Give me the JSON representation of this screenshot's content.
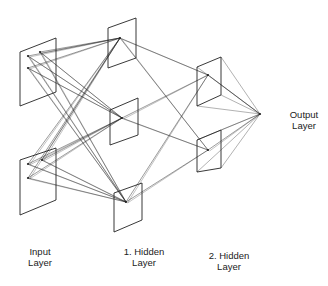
{
  "diagram": {
    "type": "neural-network",
    "labels": {
      "input": [
        "Input",
        "Layer"
      ],
      "hidden1": [
        "1. Hidden",
        "Layer"
      ],
      "hidden2": [
        "2. Hidden",
        "Layer"
      ],
      "output": [
        "Output",
        "Layer"
      ]
    },
    "layers": [
      {
        "name": "input",
        "planes": [
          {
            "pts": [
              [
                20,
                52
              ],
              [
                56,
                38
              ],
              [
                56,
                92
              ],
              [
                20,
                106
              ]
            ],
            "nodes": [
              [
                28,
                56
              ],
              [
                40,
                52
              ],
              [
                28,
                68
              ]
            ]
          },
          {
            "pts": [
              [
                20,
                160
              ],
              [
                56,
                148
              ],
              [
                56,
                200
              ],
              [
                20,
                215
              ]
            ],
            "nodes": [
              [
                28,
                164
              ],
              [
                42,
                160
              ],
              [
                28,
                178
              ]
            ]
          }
        ]
      },
      {
        "name": "hidden1",
        "planes": [
          {
            "pts": [
              [
                108,
                28
              ],
              [
                136,
                18
              ],
              [
                136,
                58
              ],
              [
                108,
                68
              ]
            ],
            "nodes": [
              [
                120,
                38
              ]
            ]
          },
          {
            "pts": [
              [
                110,
                110
              ],
              [
                138,
                98
              ],
              [
                138,
                135
              ],
              [
                110,
                145
              ]
            ],
            "nodes": [
              [
                122,
                118
              ]
            ]
          },
          {
            "pts": [
              [
                114,
                193
              ],
              [
                142,
                183
              ],
              [
                142,
                220
              ],
              [
                114,
                232
              ]
            ],
            "nodes": [
              [
                126,
                202
              ]
            ]
          }
        ]
      },
      {
        "name": "hidden2",
        "planes": [
          {
            "pts": [
              [
                197,
                67
              ],
              [
                221,
                57
              ],
              [
                221,
                95
              ],
              [
                197,
                106
              ]
            ],
            "nodes": [
              [
                208,
                75
              ]
            ]
          },
          {
            "pts": [
              [
                197,
                140
              ],
              [
                221,
                130
              ],
              [
                221,
                168
              ],
              [
                197,
                172
              ]
            ],
            "nodes": [
              [
                208,
                150
              ]
            ]
          }
        ]
      },
      {
        "name": "output",
        "nodes": [
          [
            260,
            114
          ]
        ]
      }
    ],
    "colors": {
      "line": "#222222",
      "background": "#ffffff"
    }
  }
}
